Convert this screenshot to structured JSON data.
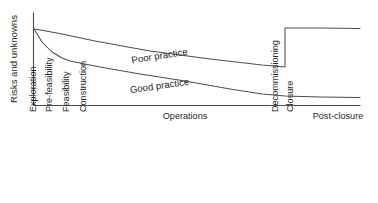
{
  "chart_data": {
    "type": "line",
    "title": "",
    "subtitle": "",
    "xlabel": "",
    "ylabel": "Risks and unknowns",
    "grid": false,
    "legend_position": "inline-labels",
    "axes": {
      "y_axis_label": "Risks and unknowns",
      "y_ticks": [],
      "x_ticks": [],
      "xlim_categories": [
        "Exploration",
        "Pre-feasibility",
        "Feasibility",
        "Construction",
        "Operations",
        "Decommissioning",
        "Closure",
        "Post-closure"
      ]
    },
    "stage_labels": [
      {
        "text": "Exploration",
        "orientation": "vertical",
        "x": 36,
        "y": 112
      },
      {
        "text": "Pre-feasibility",
        "orientation": "vertical",
        "x": 52,
        "y": 112
      },
      {
        "text": "Feasibility",
        "orientation": "vertical",
        "x": 69,
        "y": 112
      },
      {
        "text": "Construction",
        "orientation": "vertical",
        "x": 86,
        "y": 112
      },
      {
        "text": "Operations",
        "orientation": "horizontal",
        "x": 185,
        "y": 119
      },
      {
        "text": "Decommissioning",
        "orientation": "vertical",
        "x": 278,
        "y": 112
      },
      {
        "text": "Closure",
        "orientation": "vertical",
        "x": 293,
        "y": 112
      },
      {
        "text": "Post-closure",
        "orientation": "horizontal",
        "x": 338,
        "y": 119
      }
    ],
    "series": [
      {
        "name": "Poor practice",
        "label_text": "Poor practice",
        "label_x": 160,
        "label_y": 59,
        "label_rotation": -9,
        "points": [
          [
            34,
            29
          ],
          [
            46,
            31
          ],
          [
            62,
            34
          ],
          [
            95,
            41
          ],
          [
            150,
            51
          ],
          [
            210,
            59
          ],
          [
            262,
            65
          ],
          [
            285,
            67
          ],
          [
            285,
            28
          ],
          [
            320,
            28
          ],
          [
            360,
            28.5
          ]
        ]
      },
      {
        "name": "Good practice",
        "label_text": "Good practice",
        "label_x": 160,
        "label_y": 89,
        "label_rotation": -8,
        "points": [
          [
            34,
            29
          ],
          [
            42,
            42
          ],
          [
            52,
            52
          ],
          [
            62,
            58
          ],
          [
            70,
            61
          ],
          [
            100,
            67
          ],
          [
            140,
            74
          ],
          [
            185,
            81
          ],
          [
            230,
            89
          ],
          [
            262,
            94
          ],
          [
            285,
            96
          ],
          [
            320,
            97
          ],
          [
            360,
            97.5
          ]
        ]
      }
    ],
    "axis_geometry": {
      "y_axis_x": 33.5,
      "y_axis_top": 13,
      "x_axis_y": 105.5,
      "x_axis_right": 360
    },
    "colors": {
      "line": "#4d4d4d",
      "axis": "#4d4d4d",
      "text": "#231f20",
      "background": "#ffffff"
    }
  }
}
